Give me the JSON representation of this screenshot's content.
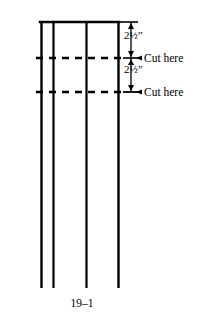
{
  "figure": {
    "caption": "19–1",
    "background_color": "#ffffff",
    "line_color": "#000000",
    "dimensions": [
      {
        "id": "top",
        "value": "2",
        "fraction_numerator": "1",
        "fraction_denominator": "2",
        "unit": "”",
        "full_text": "2½”"
      },
      {
        "id": "bottom",
        "value": "2",
        "fraction_numerator": "1",
        "fraction_denominator": "2",
        "unit": "”",
        "full_text": "2½”"
      }
    ],
    "cut_labels": [
      {
        "id": "top",
        "text": "Cut here"
      },
      {
        "id": "bottom",
        "text": "Cut here"
      }
    ],
    "geometry": {
      "top_edge_y": 22,
      "bottom_edge_y": 288,
      "vertical_lines_x": [
        41,
        53,
        86,
        118
      ],
      "dashed_lines_y": [
        58,
        92
      ],
      "dimension_line_x": 131,
      "dash_pattern": "7 6",
      "stroke_width": 2.2
    }
  }
}
